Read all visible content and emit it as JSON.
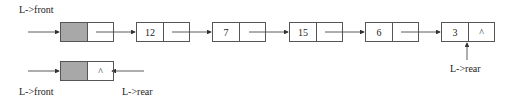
{
  "top_list": {
    "front_label": "L->front",
    "rear_label": "L->rear",
    "head_node": {
      "data": "",
      "next": ""
    },
    "nodes": [
      {
        "data": "12",
        "next": ""
      },
      {
        "data": "7",
        "next": ""
      },
      {
        "data": "15",
        "next": ""
      },
      {
        "data": "6",
        "next": ""
      },
      {
        "data": "3",
        "next": "^"
      }
    ]
  },
  "empty_list": {
    "front_label": "L->front",
    "rear_label": "L->rear",
    "head_node": {
      "data": "",
      "next": "^"
    }
  },
  "colors": {
    "head_fill": "#a8a8a8",
    "line": "#333333"
  }
}
